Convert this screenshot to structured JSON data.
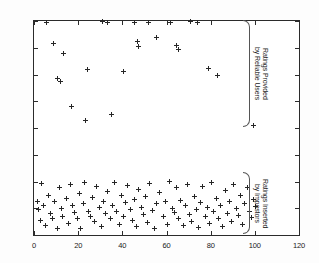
{
  "chart_data": {
    "type": "scatter",
    "title": "",
    "xlabel": "",
    "ylabel": "",
    "xlim": [
      0,
      120
    ],
    "ylim": [
      1,
      5
    ],
    "xticks": [
      0,
      20,
      40,
      60,
      80,
      100,
      120
    ],
    "yticks": [
      1,
      1.5,
      2,
      2.5,
      3,
      3.5,
      4,
      4.5,
      5
    ],
    "xtick_labels": [
      "0",
      "20",
      "40",
      "60",
      "80",
      "100",
      "120"
    ],
    "ytick_labels": [
      "1",
      "1.5",
      "2",
      "2.5",
      "3",
      "3.5",
      "4",
      "4.5",
      "5"
    ],
    "grid": false,
    "legend": "none",
    "marker": "+",
    "marker_color": "#262626",
    "series": [
      {
        "name": "Ratings Provided by Reliable Users",
        "marker": "+",
        "points": [
          [
            5.5,
            4.98
          ],
          [
            9.0,
            4.58
          ],
          [
            13.5,
            4.4
          ],
          [
            10.5,
            3.93
          ],
          [
            12.0,
            3.86
          ],
          [
            17.0,
            3.4
          ],
          [
            23.5,
            3.14
          ],
          [
            24.0,
            4.1
          ],
          [
            31.0,
            5.0
          ],
          [
            33.5,
            4.98
          ],
          [
            35.0,
            3.25
          ],
          [
            40.5,
            4.06
          ],
          [
            45.5,
            4.98
          ],
          [
            47.5,
            4.52
          ],
          [
            47.0,
            4.62
          ],
          [
            52.0,
            4.98
          ],
          [
            55.5,
            4.7
          ],
          [
            62.0,
            4.98
          ],
          [
            64.5,
            4.55
          ],
          [
            65.5,
            4.47
          ],
          [
            71.0,
            5.0
          ],
          [
            74.0,
            4.98
          ],
          [
            79.0,
            4.12
          ],
          [
            83.0,
            3.98
          ],
          [
            99.5,
            3.05
          ]
        ]
      },
      {
        "name": "Ratings Inserted by Impostors",
        "marker": "+",
        "points": [
          [
            1.5,
            1.62
          ],
          [
            2.0,
            1.48
          ],
          [
            3.0,
            1.28
          ],
          [
            3.5,
            1.96
          ],
          [
            4.5,
            1.55
          ],
          [
            5.0,
            1.18
          ],
          [
            6.5,
            1.74
          ],
          [
            7.5,
            1.41
          ],
          [
            8.5,
            1.3
          ],
          [
            9.5,
            1.62
          ],
          [
            10.5,
            1.12
          ],
          [
            11.5,
            1.88
          ],
          [
            12.5,
            1.5
          ],
          [
            13.0,
            1.35
          ],
          [
            14.5,
            1.68
          ],
          [
            15.5,
            1.22
          ],
          [
            16.5,
            1.95
          ],
          [
            17.5,
            1.55
          ],
          [
            18.5,
            1.42
          ],
          [
            19.5,
            1.3
          ],
          [
            20.5,
            1.78
          ],
          [
            21.0,
            1.12
          ],
          [
            22.5,
            1.58
          ],
          [
            23.0,
            1.98
          ],
          [
            24.5,
            1.44
          ],
          [
            25.5,
            1.35
          ],
          [
            26.5,
            1.7
          ],
          [
            27.5,
            1.25
          ],
          [
            28.5,
            1.9
          ],
          [
            29.5,
            1.52
          ],
          [
            30.5,
            1.16
          ],
          [
            31.5,
            1.62
          ],
          [
            32.5,
            1.4
          ],
          [
            33.5,
            1.82
          ],
          [
            34.5,
            1.3
          ],
          [
            35.5,
            1.55
          ],
          [
            36.5,
            1.98
          ],
          [
            37.5,
            1.44
          ],
          [
            38.5,
            1.2
          ],
          [
            39.5,
            1.74
          ],
          [
            40.5,
            1.35
          ],
          [
            41.5,
            1.6
          ],
          [
            42.5,
            1.92
          ],
          [
            43.5,
            1.48
          ],
          [
            44.5,
            1.28
          ],
          [
            45.5,
            1.66
          ],
          [
            46.5,
            1.15
          ],
          [
            47.5,
            1.85
          ],
          [
            48.5,
            1.52
          ],
          [
            49.5,
            1.38
          ],
          [
            50.5,
            1.72
          ],
          [
            51.5,
            1.24
          ],
          [
            52.5,
            1.96
          ],
          [
            53.5,
            1.45
          ],
          [
            54.5,
            1.12
          ],
          [
            55.5,
            1.58
          ],
          [
            57.0,
            1.8
          ],
          [
            58.5,
            1.34
          ],
          [
            59.5,
            1.62
          ],
          [
            60.5,
            1.2
          ],
          [
            61.5,
            2.0
          ],
          [
            62.5,
            1.5
          ],
          [
            63.5,
            1.42
          ],
          [
            64.5,
            1.88
          ],
          [
            65.5,
            1.3
          ],
          [
            66.5,
            1.65
          ],
          [
            67.5,
            1.18
          ],
          [
            68.5,
            1.55
          ],
          [
            69.5,
            1.95
          ],
          [
            70.5,
            1.38
          ],
          [
            71.5,
            1.26
          ],
          [
            72.5,
            1.72
          ],
          [
            73.5,
            1.48
          ],
          [
            74.5,
            1.14
          ],
          [
            75.5,
            1.6
          ],
          [
            76.5,
            1.9
          ],
          [
            77.5,
            1.35
          ],
          [
            78.5,
            1.52
          ],
          [
            79.5,
            1.22
          ],
          [
            80.5,
            1.98
          ],
          [
            81.5,
            1.44
          ],
          [
            82.5,
            1.68
          ],
          [
            83.5,
            1.3
          ],
          [
            84.5,
            1.56
          ],
          [
            85.5,
            1.16
          ],
          [
            86.5,
            1.84
          ],
          [
            87.5,
            1.4
          ],
          [
            88.5,
            1.62
          ],
          [
            89.5,
            1.26
          ],
          [
            90.5,
            1.94
          ],
          [
            91.5,
            1.5
          ],
          [
            92.5,
            1.36
          ],
          [
            93.5,
            1.74
          ],
          [
            94.5,
            1.2
          ],
          [
            95.5,
            1.58
          ],
          [
            96.5,
            1.88
          ],
          [
            97.5,
            1.44
          ],
          [
            98.5,
            1.32
          ],
          [
            99.5,
            1.66
          ],
          [
            100.5,
            1.54
          ]
        ]
      }
    ],
    "annotations": [
      {
        "name": "reliable-users-brace",
        "text": "Ratings Provided\nby Reliable Users",
        "y_range": [
          3.0,
          5.0
        ]
      },
      {
        "name": "impostors-brace",
        "text": "Ratings Inserted\nby Impostors",
        "y_range": [
          1.0,
          2.15
        ]
      }
    ]
  }
}
